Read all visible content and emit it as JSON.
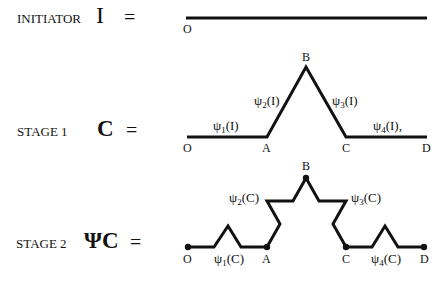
{
  "rows": [
    {
      "label": "INITIATOR",
      "symbol": "I",
      "equals": "=",
      "points": [
        "O"
      ]
    },
    {
      "label": "STAGE 1",
      "symbol": "C",
      "equals": "=",
      "points": [
        "O",
        "A",
        "B",
        "C",
        "D"
      ],
      "segments": [
        {
          "psi": "ψ",
          "index": "1",
          "arg": "(I)"
        },
        {
          "psi": "ψ",
          "index": "2",
          "arg": "(I)"
        },
        {
          "psi": "ψ",
          "index": "3",
          "arg": "(I)"
        },
        {
          "psi": "ψ",
          "index": "4",
          "arg": "(I),"
        }
      ]
    },
    {
      "label": "STAGE 2",
      "symbol": "ΨC",
      "equals": "=",
      "points": [
        "O",
        "A",
        "B",
        "C",
        "D"
      ],
      "segments": [
        {
          "psi": "ψ",
          "index": "1",
          "arg": "(C)"
        },
        {
          "psi": "ψ",
          "index": "2",
          "arg": "(C)"
        },
        {
          "psi": "ψ",
          "index": "3",
          "arg": "(C)"
        },
        {
          "psi": "ψ",
          "index": "4",
          "arg": "(C)"
        }
      ]
    }
  ],
  "colors": {
    "stroke": "#111111",
    "text": "#111111"
  }
}
